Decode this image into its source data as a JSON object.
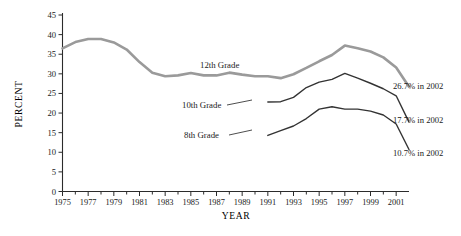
{
  "chart_data": {
    "type": "line",
    "title": "",
    "xlabel": "YEAR",
    "ylabel": "PERCENT",
    "xlim": [
      1975,
      2002
    ],
    "ylim": [
      0,
      45
    ],
    "y_ticks": [
      0,
      5,
      10,
      15,
      20,
      25,
      30,
      35,
      40,
      45
    ],
    "x_ticks_labeled": [
      1975,
      1977,
      1979,
      1981,
      1983,
      1985,
      1987,
      1989,
      1991,
      1993,
      1995,
      1997,
      1999,
      2001
    ],
    "x_ticks_all": [
      1975,
      1976,
      1977,
      1978,
      1979,
      1980,
      1981,
      1982,
      1983,
      1984,
      1985,
      1986,
      1987,
      1988,
      1989,
      1990,
      1991,
      1992,
      1993,
      1994,
      1995,
      1996,
      1997,
      1998,
      1999,
      2000,
      2001,
      2002
    ],
    "grid": false,
    "legend_position": "inline-labels",
    "series": [
      {
        "name": "12th Grade",
        "color": "#9a9a9a",
        "x": [
          1975,
          1976,
          1977,
          1978,
          1979,
          1980,
          1981,
          1982,
          1983,
          1984,
          1985,
          1986,
          1987,
          1988,
          1989,
          1990,
          1991,
          1992,
          1993,
          1994,
          1995,
          1996,
          1997,
          1998,
          1999,
          2000,
          2001,
          2002
        ],
        "values": [
          36.5,
          38.1,
          38.9,
          38.9,
          38.0,
          36.2,
          33.0,
          30.3,
          29.4,
          29.6,
          30.2,
          29.6,
          29.6,
          30.3,
          29.8,
          29.4,
          29.4,
          28.9,
          29.9,
          31.5,
          33.2,
          34.8,
          37.2,
          36.5,
          35.7,
          34.2,
          31.6,
          26.7
        ]
      },
      {
        "name": "10th Grade",
        "color": "#333333",
        "x": [
          1991,
          1992,
          1993,
          1994,
          1995,
          1996,
          1997,
          1998,
          1999,
          2000,
          2001,
          2002
        ],
        "values": [
          22.8,
          22.9,
          24.0,
          26.5,
          27.9,
          28.6,
          30.1,
          28.9,
          27.6,
          26.2,
          24.4,
          17.7
        ]
      },
      {
        "name": "8th Grade",
        "color": "#333333",
        "x": [
          1991,
          1992,
          1993,
          1994,
          1995,
          1996,
          1997,
          1998,
          1999,
          2000,
          2001,
          2002
        ],
        "values": [
          14.3,
          15.5,
          16.7,
          18.6,
          21.0,
          21.6,
          21.0,
          21.0,
          20.5,
          19.5,
          17.2,
          10.7
        ]
      }
    ],
    "annotations": [
      {
        "text": "12th Grade",
        "series": "12th Grade"
      },
      {
        "text": "10th Grade",
        "series": "10th Grade"
      },
      {
        "text": "8th Grade",
        "series": "8th Grade"
      },
      {
        "text": "26.7% in 2002",
        "series": "12th Grade"
      },
      {
        "text": "17.7% in 2002",
        "series": "10th Grade"
      },
      {
        "text": "10.7% in 2002",
        "series": "8th Grade"
      }
    ]
  },
  "labels": {
    "y_axis_title": "PERCENT",
    "x_axis_title": "YEAR",
    "series_12": "12th Grade",
    "series_10": "10th Grade",
    "series_8": "8th Grade",
    "end_12": "26.7% in 2002",
    "end_10": "17.7% in 2002",
    "end_8": "10.7% in 2002"
  }
}
